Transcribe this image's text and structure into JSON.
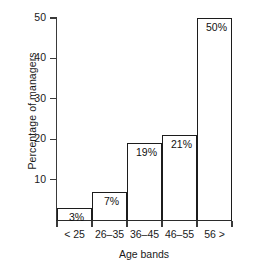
{
  "chart_data": {
    "type": "bar",
    "title": "",
    "xlabel": "Age bands",
    "ylabel": "Percentage of managers",
    "categories": [
      "< 25",
      "26–35",
      "36–45",
      "46–55",
      "56 >"
    ],
    "values": [
      3,
      7,
      19,
      21,
      50
    ],
    "data_labels": [
      "3%",
      "7%",
      "19%",
      "21%",
      "50%"
    ],
    "ylim": [
      0,
      50
    ],
    "yticks": [
      10,
      20,
      30,
      40,
      50
    ],
    "ytick_labels": [
      "10",
      "20",
      "30",
      "40",
      "50"
    ],
    "grid": false,
    "legend": null,
    "bar_fill_color": "#ffffff",
    "bar_edge_color": "#1c1c1c",
    "axis_color": "#3a3a3a",
    "text_color": "#1a1a1a"
  }
}
